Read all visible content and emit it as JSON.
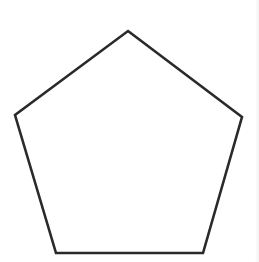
{
  "canvas": {
    "background_color": "#ffffff",
    "width": "259",
    "height": "262",
    "viewbox": "0 0 259 262"
  },
  "shape": {
    "name": "pentagon",
    "description": "outline drawing of a pentagon",
    "points": "128,31 242,117 203,253 56,253 15,115",
    "stroke_color": "#2a2a2a",
    "stroke_width": "2.6",
    "fill": "none",
    "linejoin": "miter"
  }
}
